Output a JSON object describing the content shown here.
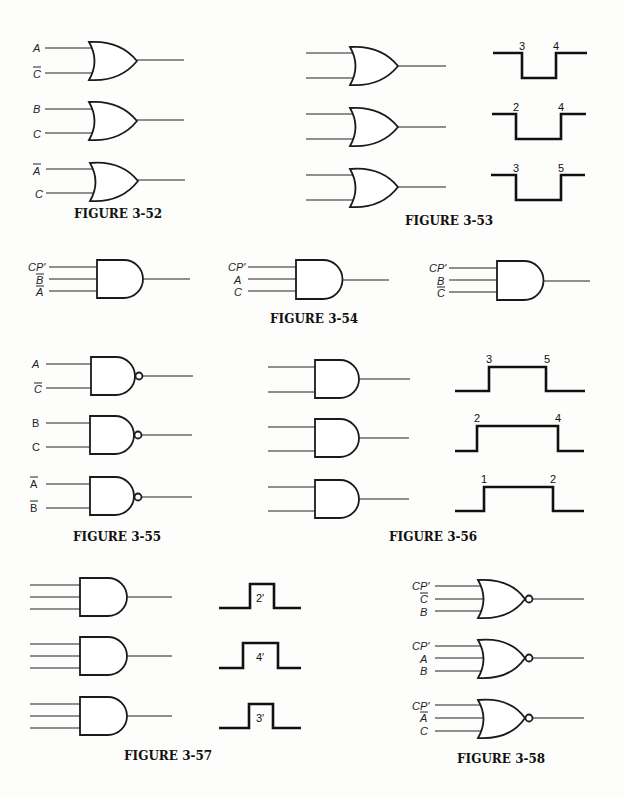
{
  "figures": [
    {
      "caption": "FIGURE 3-52",
      "gate_type": "OR",
      "gates": [
        {
          "inputs": [
            {
              "label": "A",
              "inverted": false
            },
            {
              "label": "C",
              "inverted": true
            }
          ]
        },
        {
          "inputs": [
            {
              "label": "B",
              "inverted": false
            },
            {
              "label": "C",
              "inverted": false
            }
          ]
        },
        {
          "inputs": [
            {
              "label": "A",
              "inverted": true
            },
            {
              "label": "C",
              "inverted": false
            }
          ]
        }
      ]
    },
    {
      "caption": "FIGURE 3-53",
      "gate_type": "OR",
      "gates": [
        {
          "inputs": 2
        },
        {
          "inputs": 2
        },
        {
          "inputs": 2
        }
      ],
      "waveforms": [
        {
          "shape": "negative-pulse",
          "edge_labels": [
            "3",
            "4"
          ]
        },
        {
          "shape": "negative-pulse",
          "edge_labels": [
            "2",
            "4"
          ]
        },
        {
          "shape": "negative-pulse",
          "edge_labels": [
            "3",
            "5"
          ]
        }
      ]
    },
    {
      "caption": "FIGURE 3-54",
      "gate_type": "AND",
      "gates": [
        {
          "inputs": [
            {
              "label": "CP'",
              "inverted": false
            },
            {
              "label": "B",
              "inverted": true
            },
            {
              "label": "A",
              "inverted": true
            }
          ]
        },
        {
          "inputs": [
            {
              "label": "CP'",
              "inverted": false
            },
            {
              "label": "A",
              "inverted": false
            },
            {
              "label": "C",
              "inverted": false
            }
          ]
        },
        {
          "inputs": [
            {
              "label": "CP'",
              "inverted": false
            },
            {
              "label": "B",
              "inverted": false
            },
            {
              "label": "C",
              "inverted": true
            }
          ]
        }
      ]
    },
    {
      "caption": "FIGURE 3-55",
      "gate_type": "NAND",
      "gates": [
        {
          "inputs": [
            {
              "label": "A",
              "inverted": false
            },
            {
              "label": "C",
              "inverted": true
            }
          ]
        },
        {
          "inputs": [
            {
              "label": "B",
              "inverted": false
            },
            {
              "label": "C",
              "inverted": false
            }
          ]
        },
        {
          "inputs": [
            {
              "label": "A",
              "inverted": true
            },
            {
              "label": "B",
              "inverted": true
            }
          ]
        }
      ]
    },
    {
      "caption": "FIGURE 3-56",
      "gate_type": "AND",
      "gates": [
        {
          "inputs": 2
        },
        {
          "inputs": 2
        },
        {
          "inputs": 2
        }
      ],
      "waveforms": [
        {
          "shape": "positive-pulse",
          "edge_labels": [
            "3",
            "5"
          ]
        },
        {
          "shape": "positive-pulse",
          "edge_labels": [
            "2",
            "4"
          ]
        },
        {
          "shape": "positive-pulse",
          "edge_labels": [
            "1",
            "2"
          ]
        }
      ]
    },
    {
      "caption": "FIGURE 3-57",
      "gate_type": "AND",
      "gates": [
        {
          "inputs": 3
        },
        {
          "inputs": 3
        },
        {
          "inputs": 3
        }
      ],
      "waveforms": [
        {
          "shape": "positive-pulse",
          "pulse_label": "2′"
        },
        {
          "shape": "positive-pulse",
          "pulse_label": "4′"
        },
        {
          "shape": "positive-pulse",
          "pulse_label": "3′"
        }
      ]
    },
    {
      "caption": "FIGURE 3-58",
      "gate_type": "NOR",
      "gates": [
        {
          "inputs": [
            {
              "label": "CP'",
              "inverted": false
            },
            {
              "label": "C",
              "inverted": true
            },
            {
              "label": "B",
              "inverted": false
            }
          ]
        },
        {
          "inputs": [
            {
              "label": "CP'",
              "inverted": false
            },
            {
              "label": "A",
              "inverted": false
            },
            {
              "label": "B",
              "inverted": false
            }
          ]
        },
        {
          "inputs": [
            {
              "label": "CP'",
              "inverted": false
            },
            {
              "label": "A",
              "inverted": true
            },
            {
              "label": "C",
              "inverted": false
            }
          ]
        }
      ]
    }
  ]
}
